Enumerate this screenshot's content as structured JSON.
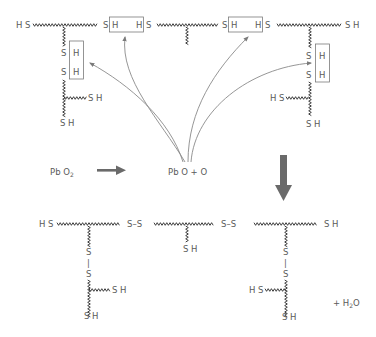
{
  "diagram": {
    "title": "",
    "colors": {
      "text": "#5a5a5a",
      "chain": "#2a2a2a",
      "arrow": "#6a6a6a",
      "curve": "#8a8a8a"
    },
    "top": {
      "chain_left_end": "H S",
      "box1_left_s": "S",
      "box1_left_h": "H",
      "box1_right_h": "H",
      "box1_right_s": "S",
      "box2_left_s": "S",
      "box2_left_h": "H",
      "box2_right_h": "H",
      "box2_right_s": "S",
      "chain_right_end": "S H",
      "left_branch": {
        "box_s1": "S",
        "box_h1": "H",
        "box_s2": "S",
        "box_h2": "H",
        "side_end": "S H",
        "bottom_end": "S H"
      },
      "right_branch": {
        "box_s1": "S",
        "box_h1": "H",
        "box_s2": "S",
        "box_h2": "H",
        "side_end": "H S",
        "bottom_end": "S H"
      }
    },
    "reaction": {
      "reactant": "Pb O",
      "reactant_sub": "2",
      "products": "Pb O + O"
    },
    "bottom": {
      "chain_left_end": "H S",
      "bridge1": "S–S",
      "bridge2": "S–S",
      "chain_right_end": "S H",
      "mid_end": "S H",
      "left_branch": {
        "s_top": "S",
        "bond": "|",
        "s_bottom": "S",
        "side_end": "S H",
        "bottom_end": "S H"
      },
      "right_branch": {
        "s_top": "S",
        "bond": "|",
        "s_bottom": "S",
        "side_end": "H S",
        "bottom_end": "S H"
      },
      "byproduct_prefix": "+ H",
      "byproduct_sub": "2",
      "byproduct_suffix": "O"
    }
  }
}
